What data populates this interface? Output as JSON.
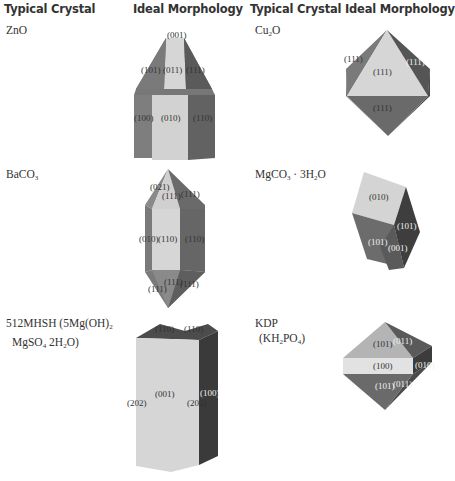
{
  "headers": {
    "left_crystal": "Typical Crystal",
    "left_morphology": "Ideal Morphology",
    "right_crystal": "Typical Crystal",
    "right_morphology": "Ideal Morphology"
  },
  "crystals": [
    {
      "id": "zno",
      "name_parts": [
        "ZnO"
      ],
      "faces": [
        "(001)",
        "(101)",
        "(011)",
        "(111)",
        "(100)",
        "(010)",
        "(110)"
      ]
    },
    {
      "id": "cu2o",
      "name_parts": [
        "Cu",
        "2",
        "O"
      ],
      "faces": [
        "(111)",
        "(111)",
        "(111)",
        "(111)"
      ]
    },
    {
      "id": "baco3",
      "name_parts": [
        "BaCO",
        "3"
      ],
      "faces": [
        "(021)",
        "(111)",
        "(111)",
        "(010)",
        "(110)",
        "(110)",
        "(111)",
        "(111)",
        "(111)"
      ]
    },
    {
      "id": "mgco3",
      "name_parts": [
        "MgCO",
        "3",
        " · 3H",
        "2",
        "O"
      ],
      "faces": [
        "(010)",
        "(101)",
        "(101)",
        "(001)"
      ]
    },
    {
      "id": "512mhsh",
      "name_line1_parts": [
        "512MHSH (5Mg(OH)",
        "2"
      ],
      "name_line2_parts": [
        "MgSO",
        "4",
        " 2H",
        "2",
        "O)"
      ],
      "faces": [
        "(110)",
        "(110)",
        "(001)",
        "(202)",
        "(202)",
        "(100)"
      ]
    },
    {
      "id": "kdp",
      "name_line1": "KDP",
      "name_line2_parts": [
        "(KH",
        "2",
        "PO",
        "4",
        ")"
      ],
      "faces": [
        "(101)",
        "(011)",
        "(100)",
        "(010)",
        "(101)",
        "(011)"
      ]
    }
  ],
  "colors": {
    "light_face": "#d6d6d6",
    "mid_face": "#8a8a8a",
    "dark_face": "#5e5e5e",
    "darkest_face": "#3e3e3e",
    "text": "#333333"
  }
}
